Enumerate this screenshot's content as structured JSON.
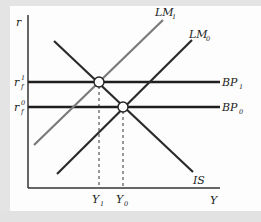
{
  "diagram": {
    "axes": {
      "y_label": "r",
      "x_label": "Y"
    },
    "curves": {
      "lm1": {
        "label": "LM",
        "sub": "1",
        "color": "#7a7a7a"
      },
      "lm0": {
        "label": "LM",
        "sub": "0",
        "color": "#2a2a2a"
      },
      "is": {
        "label": "IS",
        "color": "#2a2a2a"
      },
      "bp1": {
        "label": "BP",
        "sub": "1",
        "color": "#1e1e1e"
      },
      "bp0": {
        "label": "BP",
        "sub": "0",
        "color": "#1e1e1e"
      }
    },
    "y_ticks": [
      {
        "label": "r",
        "sup": "1",
        "sub": "f"
      },
      {
        "label": "r",
        "sup": "0",
        "sub": "f"
      }
    ],
    "x_ticks": [
      {
        "label": "Y",
        "sub": "1"
      },
      {
        "label": "Y",
        "sub": "0"
      }
    ],
    "equilibria": [
      {
        "name": "equilibrium-1",
        "curves": "IS ∩ LM1 ∩ BP1"
      },
      {
        "name": "equilibrium-0",
        "curves": "IS ∩ LM0 ∩ BP0"
      }
    ]
  }
}
